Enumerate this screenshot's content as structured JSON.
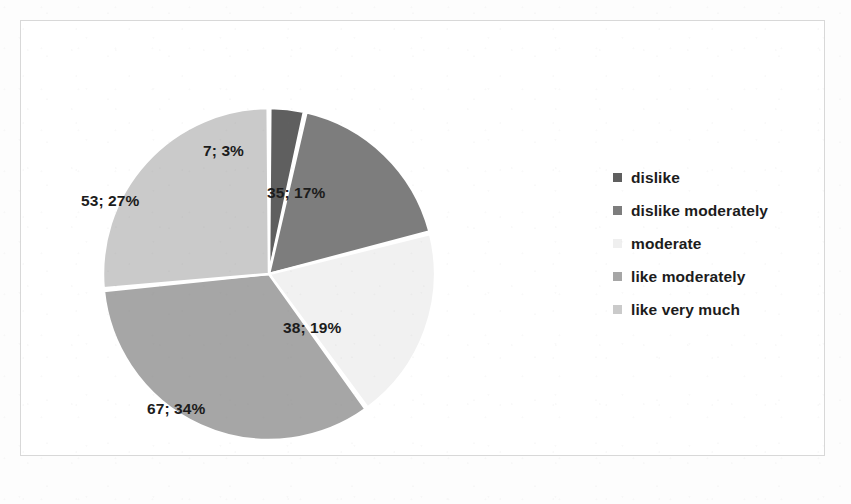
{
  "chart_data": {
    "type": "pie",
    "title": "",
    "subtitle": "",
    "xlabel": "",
    "ylabel": "",
    "legend_position": "right",
    "grid": false,
    "total": 200,
    "categories": [
      "dislike",
      "dislike moderately",
      " moderate",
      "like moderately",
      "like very much"
    ],
    "values": [
      7,
      35,
      38,
      67,
      53
    ],
    "percents": [
      3,
      17,
      19,
      34,
      27
    ],
    "data_labels": [
      "7; 3%",
      "35; 17%",
      "38; 19%",
      "67; 34%",
      "53; 27%"
    ],
    "colors": [
      "#5f5f5f",
      "#7d7d7d",
      "#f1f1f1",
      "#a6a6a6",
      "#cacaca"
    ],
    "slices": [
      {
        "label": "dislike",
        "value": 7,
        "percent": 3,
        "data_label": "7; 3%",
        "color": "#5f5f5f"
      },
      {
        "label": "dislike moderately",
        "value": 35,
        "percent": 17,
        "data_label": "35; 17%",
        "color": "#7d7d7d"
      },
      {
        "label": " moderate",
        "value": 38,
        "percent": 19,
        "data_label": "38; 19%",
        "color": "#f1f1f1"
      },
      {
        "label": "like moderately",
        "value": 67,
        "percent": 34,
        "data_label": "67; 34%",
        "color": "#a6a6a6"
      },
      {
        "label": "like very much",
        "value": 53,
        "percent": 27,
        "data_label": "53; 27%",
        "color": "#cacaca"
      }
    ]
  },
  "labels": {
    "slice_0": "7; 3%",
    "slice_1": "35; 17%",
    "slice_2": "38; 19%",
    "slice_3": "67; 34%",
    "slice_4": "53; 27%"
  },
  "legend": {
    "items": [
      {
        "label": "dislike",
        "color": "#5f5f5f"
      },
      {
        "label": "dislike moderately",
        "color": "#7d7d7d"
      },
      {
        "label": " moderate",
        "color": "#efefef"
      },
      {
        "label": "like moderately",
        "color": "#a6a6a6"
      },
      {
        "label": "like very much",
        "color": "#cacaca"
      }
    ]
  }
}
